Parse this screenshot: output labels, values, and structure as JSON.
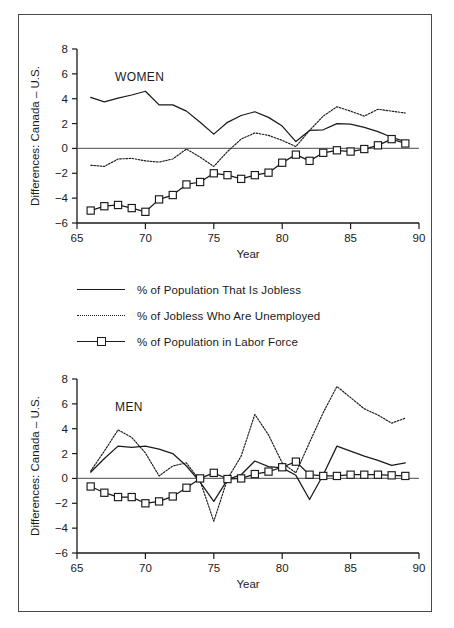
{
  "figure": {
    "legend": [
      {
        "key": "jobless",
        "label": "% of Population That Is Jobless",
        "style": "solid"
      },
      {
        "key": "unemployed",
        "label": "% of Jobless Who Are Unemployed",
        "style": "dotted"
      },
      {
        "key": "laborforce",
        "label": "% of Population in Labor Force",
        "style": "square"
      }
    ]
  },
  "chart_data": [
    {
      "type": "line",
      "title": "WOMEN",
      "xlabel": "Year",
      "ylabel": "Differences: Canada – U.S.",
      "xlim": [
        65,
        90
      ],
      "ylim": [
        -6,
        8
      ],
      "xticks": [
        65,
        70,
        75,
        80,
        85,
        90
      ],
      "yticks": [
        8,
        6,
        4,
        2,
        0,
        -2,
        -4,
        -6
      ],
      "grid": false,
      "zero_reference_line": 0,
      "legend_position": "below-figure",
      "x": [
        66,
        67,
        68,
        69,
        70,
        71,
        72,
        73,
        74,
        75,
        76,
        77,
        78,
        79,
        80,
        81,
        82,
        83,
        84,
        85,
        86,
        87,
        88,
        89
      ],
      "series": [
        {
          "name": "% of Population That Is Jobless",
          "style": "solid",
          "values": [
            4.1,
            3.75,
            4.05,
            4.3,
            4.6,
            3.5,
            3.5,
            3.0,
            2.1,
            1.15,
            2.1,
            2.65,
            2.95,
            2.5,
            1.8,
            0.55,
            1.45,
            1.5,
            2.0,
            1.95,
            1.7,
            1.35,
            0.9,
            0.55
          ]
        },
        {
          "name": "% of Jobless Who Are Unemployed",
          "style": "dotted",
          "values": [
            -1.35,
            -1.45,
            -0.85,
            -0.8,
            -1.0,
            -1.1,
            -0.85,
            -0.05,
            -0.7,
            -1.45,
            -0.25,
            0.75,
            1.25,
            1.05,
            0.65,
            0.15,
            1.45,
            2.6,
            3.35,
            3.0,
            2.6,
            3.15,
            3.0,
            2.85
          ]
        },
        {
          "name": "% of Population in Labor Force",
          "style": "square",
          "values": [
            -5.0,
            -4.65,
            -4.55,
            -4.8,
            -5.1,
            -4.1,
            -3.75,
            -2.9,
            -2.7,
            -2.0,
            -2.15,
            -2.45,
            -2.15,
            -1.95,
            -1.15,
            -0.5,
            -1.0,
            -0.35,
            -0.15,
            -0.25,
            -0.05,
            0.25,
            0.75,
            0.4
          ]
        }
      ]
    },
    {
      "type": "line",
      "title": "MEN",
      "xlabel": "Year",
      "ylabel": "Differences: Canada – U.S.",
      "xlim": [
        65,
        90
      ],
      "ylim": [
        -6,
        8
      ],
      "xticks": [
        65,
        70,
        75,
        80,
        85,
        90
      ],
      "yticks": [
        8,
        6,
        4,
        2,
        0,
        -2,
        -4,
        -6
      ],
      "grid": false,
      "zero_reference_line": 0,
      "legend_position": "above-figure",
      "x": [
        66,
        67,
        68,
        69,
        70,
        71,
        72,
        73,
        74,
        75,
        76,
        77,
        78,
        79,
        80,
        81,
        82,
        83,
        84,
        85,
        86,
        87,
        88,
        89
      ],
      "series": [
        {
          "name": "% of Population That Is Jobless",
          "style": "solid",
          "values": [
            0.5,
            1.6,
            2.6,
            2.5,
            2.6,
            2.35,
            2.0,
            1.0,
            -0.3,
            -1.85,
            -0.1,
            0.3,
            1.4,
            0.95,
            0.85,
            0.25,
            -1.7,
            0.3,
            2.6,
            2.2,
            1.8,
            1.45,
            1.05,
            1.25
          ]
        },
        {
          "name": "% of Jobless Who Are Unemployed",
          "style": "dotted",
          "values": [
            0.6,
            2.2,
            3.9,
            3.3,
            2.05,
            0.2,
            1.0,
            1.25,
            -0.2,
            -3.45,
            -0.05,
            1.8,
            5.15,
            3.5,
            1.25,
            0.45,
            2.9,
            5.3,
            7.4,
            6.5,
            5.6,
            5.1,
            4.45,
            4.85
          ]
        },
        {
          "name": "% of Population in Labor Force",
          "style": "square",
          "values": [
            -0.65,
            -1.15,
            -1.5,
            -1.5,
            -2.0,
            -1.85,
            -1.45,
            -0.75,
            0.0,
            0.45,
            -0.05,
            0.0,
            0.35,
            0.55,
            0.9,
            1.35,
            0.3,
            0.2,
            0.2,
            0.3,
            0.3,
            0.3,
            0.25,
            0.2
          ]
        }
      ]
    }
  ]
}
